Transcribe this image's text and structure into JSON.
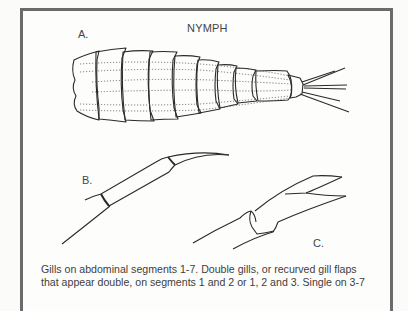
{
  "figure": {
    "title": "NYMPH",
    "labels": {
      "a": "A.",
      "b": "B.",
      "c": "C."
    },
    "panels": [
      {
        "id": "A",
        "depicts": "nymph abdomen with segments and caudal filaments"
      },
      {
        "id": "B",
        "depicts": "leg segment with single curved claw"
      },
      {
        "id": "C",
        "depicts": "leg segment with bifid claw"
      }
    ],
    "colors": {
      "border": "#6b6b6b",
      "ink": "#2a2a2a",
      "background": "#fdfdfc"
    }
  },
  "caption": {
    "line1": "Gills on abdominal segments 1-7. Double gills, or recurved gill flaps",
    "line2": "that appear double, on segments 1 and 2 or 1, 2 and 3. Single on 3-7"
  }
}
